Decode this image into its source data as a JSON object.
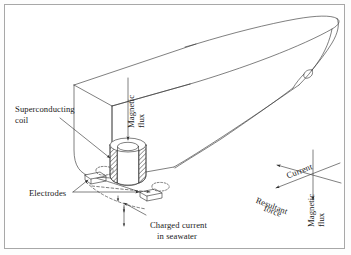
{
  "figure": {
    "frame_color": "#a8a8a8",
    "line_color": "#3a3a3a",
    "background": "#ffffff"
  },
  "labels": {
    "superconducting_coil_line1": "Superconducting",
    "superconducting_coil_line2": "coil",
    "magnetic_flux_hull_line1": "Magnetic",
    "magnetic_flux_hull_line2": "flux",
    "electrodes": "Electrodes",
    "charged_current_line1": "Charged current",
    "charged_current_line2": "in seawater"
  },
  "vector_triad": {
    "current": "Current",
    "resultant_force_line1": "Resultant",
    "resultant_force_line2": "force",
    "magnetic_flux_line1": "Magnetic",
    "magnetic_flux_line2": "flux",
    "origin_x": 313,
    "origin_y": 174
  },
  "components": {
    "coil_hatch_fill": "diagonal-hatch",
    "electrode_count": 2,
    "flow_arrow_style": "dashed"
  }
}
